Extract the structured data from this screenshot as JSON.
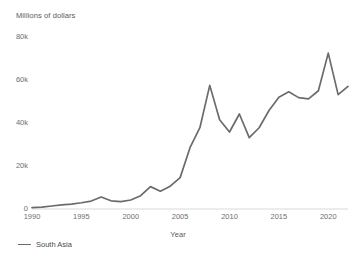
{
  "chart_data": {
    "type": "line",
    "title": "Millions of dollars",
    "xlabel": "Year",
    "ylabel": "",
    "xlim": [
      1990,
      2022
    ],
    "ylim": [
      0,
      80000
    ],
    "grid": false,
    "legend_position": "bottom-left",
    "y_ticks": [
      {
        "value": 0,
        "label": "0"
      },
      {
        "value": 20000,
        "label": "20k"
      },
      {
        "value": 40000,
        "label": "40k"
      },
      {
        "value": 60000,
        "label": "60k"
      },
      {
        "value": 80000,
        "label": "80k"
      }
    ],
    "x_ticks": [
      {
        "value": 1990,
        "label": "1990"
      },
      {
        "value": 1995,
        "label": "1995"
      },
      {
        "value": 2000,
        "label": "2000"
      },
      {
        "value": 2005,
        "label": "2005"
      },
      {
        "value": 2010,
        "label": "2010"
      },
      {
        "value": 2015,
        "label": "2015"
      },
      {
        "value": 2020,
        "label": "2020"
      }
    ],
    "x": [
      1990,
      1991,
      1992,
      1993,
      1994,
      1995,
      1996,
      1997,
      1998,
      1999,
      2000,
      2001,
      2002,
      2003,
      2004,
      2005,
      2006,
      2007,
      2008,
      2009,
      2010,
      2011,
      2012,
      2013,
      2014,
      2015,
      2016,
      2017,
      2018,
      2019,
      2020,
      2021,
      2022
    ],
    "series": [
      {
        "name": "South Asia",
        "color": "#6b6b6b",
        "values": [
          600,
          900,
          1400,
          1900,
          2300,
          2900,
          3700,
          5600,
          3800,
          3400,
          4200,
          6200,
          10400,
          8300,
          10600,
          14600,
          28500,
          37800,
          57500,
          41500,
          35800,
          44200,
          33200,
          37800,
          45800,
          52000,
          54500,
          51800,
          51200,
          55000,
          72500,
          53200,
          57000
        ]
      }
    ]
  },
  "axis": {
    "y_title": "Millions of dollars",
    "x_title": "Year"
  },
  "legend": {
    "items": [
      {
        "label": "South Asia",
        "color": "#6b6b6b"
      }
    ]
  },
  "colors": {
    "line": "#6b6b6b",
    "axis_line": "#d9d9d9",
    "tick_text": "#6e6e6e",
    "title_text": "#5a5a5a",
    "background": "#ffffff"
  }
}
